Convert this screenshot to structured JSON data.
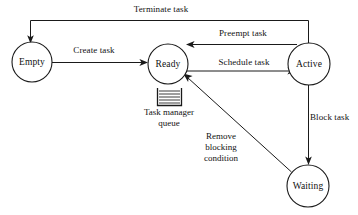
{
  "diagram": {
    "type": "state-machine",
    "colors": {
      "stroke": "#1a1a1a",
      "fill": "#ffffff",
      "text": "#111111"
    },
    "nodes": [
      {
        "id": "empty",
        "label": "Empty",
        "cx": 32,
        "cy": 62,
        "r": 20
      },
      {
        "id": "ready",
        "label": "Ready",
        "cx": 168,
        "cy": 64,
        "r": 20
      },
      {
        "id": "active",
        "label": "Active",
        "cx": 309,
        "cy": 64,
        "r": 21
      },
      {
        "id": "waiting",
        "label": "Waiting",
        "cx": 308,
        "cy": 186,
        "r": 21
      }
    ],
    "edges": [
      {
        "id": "terminate",
        "label": "Terminate task",
        "from": "active",
        "to": "empty"
      },
      {
        "id": "create",
        "label": "Create task",
        "from": "empty",
        "to": "ready"
      },
      {
        "id": "preempt",
        "label": "Preempt task",
        "from": "active",
        "to": "ready"
      },
      {
        "id": "schedule",
        "label": "Schedule task",
        "from": "ready",
        "to": "active"
      },
      {
        "id": "block",
        "label": "Block task",
        "from": "active",
        "to": "waiting"
      },
      {
        "id": "remove",
        "label": "Remove blocking condition",
        "from": "waiting",
        "to": "ready",
        "label_lines": [
          "Remove",
          "blocking",
          "condition"
        ]
      }
    ],
    "queue": {
      "icon": "queue-icon",
      "caption_lines": [
        "Task manager",
        "queue"
      ],
      "rows": 5
    }
  }
}
